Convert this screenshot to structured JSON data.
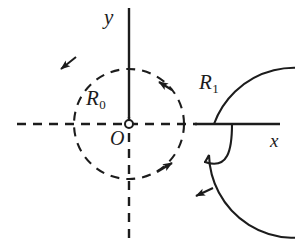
{
  "figure": {
    "kind": "diagram",
    "background_color": "#ffffff",
    "ink_color": "#1c1c1c",
    "canvas": {
      "width": 295,
      "height": 247
    }
  },
  "axes": {
    "origin": {
      "label": "O",
      "x": 129,
      "y": 124,
      "marker": "open-circle",
      "marker_radius": 4
    },
    "x_axis": {
      "label": "x",
      "y": 124,
      "dashed_from_x": 17,
      "dashed_to_x": 196,
      "solid_from_x": 196,
      "solid_to_x": 280,
      "dash_pattern": "9 7"
    },
    "y_axis": {
      "label": "y",
      "x": 129,
      "solid_from_y": 8,
      "solid_to_y": 118,
      "dashed_from_y": 118,
      "dashed_to_y": 238,
      "dash_pattern": "9 7"
    }
  },
  "contours": [
    {
      "name": "inner-contour",
      "label_base": "R",
      "label_sub": "0",
      "style": "dashed",
      "radius": 55,
      "center": {
        "cx": 129,
        "cy": 124
      },
      "dash_pattern": "9 7",
      "direction": "counterclockwise",
      "label_position": {
        "left": 86,
        "top": 88
      },
      "arrowheads": [
        {
          "angle_deg": 52,
          "points": "up-left"
        },
        {
          "angle_deg": -42,
          "points": "up-right"
        }
      ]
    },
    {
      "name": "outer-contour",
      "label_base": "R",
      "label_sub": "1",
      "style": "solid",
      "radius": 85,
      "center": {
        "cx": 129,
        "cy": 124
      },
      "direction": "counterclockwise",
      "open_gap": "spiral tail descending from the x-axis at x = 232",
      "tail_start_x": 232,
      "label_position": {
        "left": 199,
        "top": 72
      },
      "arrowheads": [
        {
          "angle_deg": 140,
          "points": "down-left"
        },
        {
          "angle_deg": -54,
          "points": "up-left"
        }
      ]
    }
  ]
}
